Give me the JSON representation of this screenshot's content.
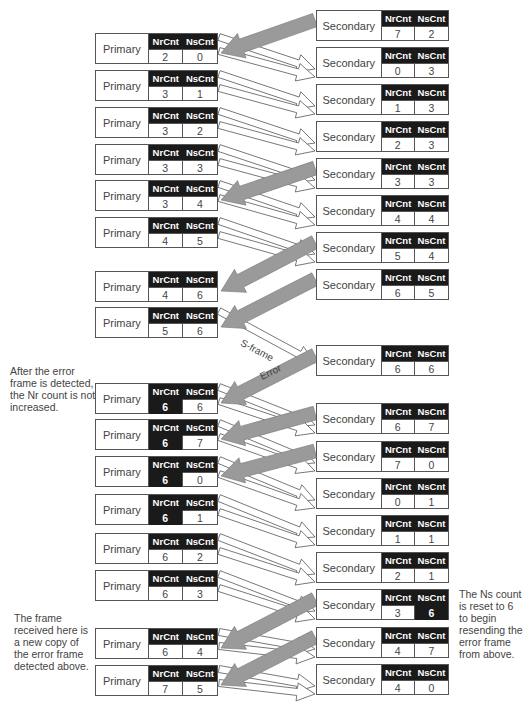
{
  "labels": {
    "primary": "Primary",
    "secondary": "Secondary",
    "nr_header": "NrCnt",
    "ns_header": "NsCnt"
  },
  "primary_stations": [
    {
      "top": 33,
      "nr": "2",
      "ns": "0",
      "nr_hl": false,
      "ns_hl": false
    },
    {
      "top": 70,
      "nr": "3",
      "ns": "1",
      "nr_hl": false,
      "ns_hl": false
    },
    {
      "top": 107,
      "nr": "3",
      "ns": "2",
      "nr_hl": false,
      "ns_hl": false
    },
    {
      "top": 144,
      "nr": "3",
      "ns": "3",
      "nr_hl": false,
      "ns_hl": false
    },
    {
      "top": 180,
      "nr": "3",
      "ns": "4",
      "nr_hl": false,
      "ns_hl": false
    },
    {
      "top": 217,
      "nr": "4",
      "ns": "5",
      "nr_hl": false,
      "ns_hl": false
    },
    {
      "top": 271,
      "nr": "4",
      "ns": "6",
      "nr_hl": false,
      "ns_hl": false
    },
    {
      "top": 307,
      "nr": "5",
      "ns": "6",
      "nr_hl": false,
      "ns_hl": false
    },
    {
      "top": 383,
      "nr": "6",
      "ns": "6",
      "nr_hl": true,
      "ns_hl": false
    },
    {
      "top": 419,
      "nr": "6",
      "ns": "7",
      "nr_hl": true,
      "ns_hl": false
    },
    {
      "top": 456,
      "nr": "6",
      "ns": "0",
      "nr_hl": true,
      "ns_hl": false
    },
    {
      "top": 494,
      "nr": "6",
      "ns": "1",
      "nr_hl": true,
      "ns_hl": false
    },
    {
      "top": 533,
      "nr": "6",
      "ns": "2",
      "nr_hl": false,
      "ns_hl": false
    },
    {
      "top": 570,
      "nr": "6",
      "ns": "3",
      "nr_hl": false,
      "ns_hl": false
    },
    {
      "top": 628,
      "nr": "6",
      "ns": "4",
      "nr_hl": false,
      "ns_hl": false
    },
    {
      "top": 665,
      "nr": "7",
      "ns": "5",
      "nr_hl": false,
      "ns_hl": false
    }
  ],
  "secondary_stations": [
    {
      "top": 10,
      "nr": "7",
      "ns": "2",
      "nr_hl": false,
      "ns_hl": false
    },
    {
      "top": 47,
      "nr": "0",
      "ns": "3",
      "nr_hl": false,
      "ns_hl": false
    },
    {
      "top": 84,
      "nr": "1",
      "ns": "3",
      "nr_hl": false,
      "ns_hl": false
    },
    {
      "top": 121,
      "nr": "2",
      "ns": "3",
      "nr_hl": false,
      "ns_hl": false
    },
    {
      "top": 158,
      "nr": "3",
      "ns": "3",
      "nr_hl": false,
      "ns_hl": false
    },
    {
      "top": 195,
      "nr": "4",
      "ns": "4",
      "nr_hl": false,
      "ns_hl": false
    },
    {
      "top": 232,
      "nr": "5",
      "ns": "4",
      "nr_hl": false,
      "ns_hl": false
    },
    {
      "top": 269,
      "nr": "6",
      "ns": "5",
      "nr_hl": false,
      "ns_hl": false
    },
    {
      "top": 345,
      "nr": "6",
      "ns": "6",
      "nr_hl": false,
      "ns_hl": false
    },
    {
      "top": 403,
      "nr": "6",
      "ns": "7",
      "nr_hl": false,
      "ns_hl": false
    },
    {
      "top": 441,
      "nr": "7",
      "ns": "0",
      "nr_hl": false,
      "ns_hl": false
    },
    {
      "top": 478,
      "nr": "0",
      "ns": "1",
      "nr_hl": false,
      "ns_hl": false
    },
    {
      "top": 515,
      "nr": "1",
      "ns": "1",
      "nr_hl": false,
      "ns_hl": false
    },
    {
      "top": 552,
      "nr": "2",
      "ns": "1",
      "nr_hl": false,
      "ns_hl": false
    },
    {
      "top": 589,
      "nr": "3",
      "ns": "6",
      "nr_hl": false,
      "ns_hl": true
    },
    {
      "top": 627,
      "nr": "4",
      "ns": "7",
      "nr_hl": false,
      "ns_hl": false
    },
    {
      "top": 664,
      "nr": "4",
      "ns": "0",
      "nr_hl": false,
      "ns_hl": false
    }
  ],
  "arrow_labels": {
    "sframe": "S-frame",
    "error": "Error"
  },
  "notes": {
    "error_detected": "After the error frame is detected, the Nr count is not increased.",
    "ns_reset": "The Ns count is reset to 6 to begin resending the error frame from above.",
    "new_copy": "The frame received here is a new copy of the error frame detected above."
  },
  "colors": {
    "header_bg": "#1a1a1a",
    "frame_arrow_fill": "#9a9a9a",
    "line": "#555555"
  }
}
